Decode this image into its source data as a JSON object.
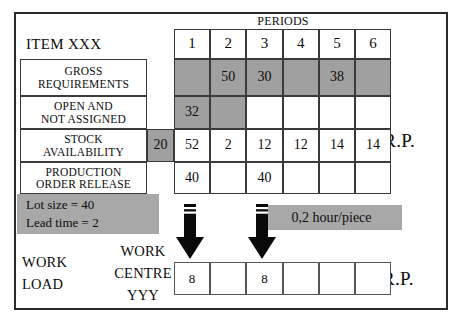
{
  "frame": {
    "periods_header": "PERIODS",
    "item_title": "ITEM XXX",
    "mrp_caption": "M.R.P.",
    "crp_caption": "C.R.P."
  },
  "mrp_table": {
    "period_numbers": [
      "1",
      "2",
      "3",
      "4",
      "5",
      "6"
    ],
    "rows": [
      {
        "label": "GROSS\nREQUIREMENTS",
        "prefix_value": "",
        "prefix_shaded": false,
        "values": [
          "",
          "50",
          "30",
          "",
          "38",
          ""
        ],
        "shaded": [
          true,
          true,
          true,
          true,
          true,
          true
        ]
      },
      {
        "label": "OPEN AND\nNOT ASSIGNED",
        "prefix_value": "",
        "prefix_shaded": false,
        "values": [
          "32",
          "",
          "",
          "",
          "",
          ""
        ],
        "shaded": [
          true,
          true,
          false,
          false,
          false,
          false
        ]
      },
      {
        "label": "STOCK\nAVAILABILITY",
        "prefix_value": "20",
        "prefix_shaded": true,
        "values": [
          "52",
          "2",
          "12",
          "12",
          "14",
          "14"
        ],
        "shaded": [
          false,
          false,
          false,
          false,
          false,
          false
        ]
      },
      {
        "label": "PRODUCTION\nORDER RELEASE",
        "prefix_value": "",
        "prefix_shaded": false,
        "values": [
          "40",
          "",
          "40",
          "",
          "",
          ""
        ],
        "shaded": [
          false,
          false,
          false,
          false,
          false,
          false
        ]
      }
    ]
  },
  "info_box": {
    "line1": "Lot size = 40",
    "line2": "Lead time = 2"
  },
  "hour_tag": {
    "text": "0,2 hour/piece"
  },
  "crp_section": {
    "workload_line1": "WORK",
    "workload_line2": "LOAD",
    "workcentre_line1": "WORK",
    "workcentre_line2": "CENTRE",
    "workcentre_line3": "YYY",
    "values": [
      "8",
      "",
      "8",
      "",
      "",
      ""
    ]
  },
  "colors": {
    "shade_gray": "#a0a0a0",
    "box_gray": "#a8a8a8",
    "border": "#3a3a3a",
    "frame": "#2a2a2a",
    "arrow": "#0a0a0a"
  }
}
